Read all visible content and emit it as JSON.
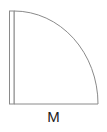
{
  "diagram": {
    "shape": "quarter-circle-with-edge-strip",
    "stroke_color": "#8a8a8a",
    "fill_color": "#ffffff",
    "label": "M"
  }
}
